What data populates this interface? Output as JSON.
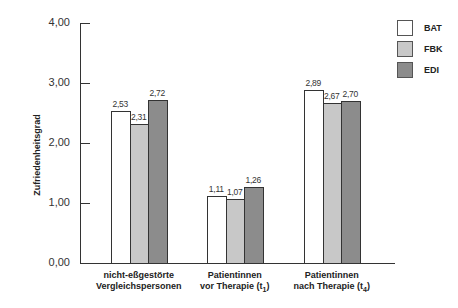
{
  "chart_data": {
    "type": "bar",
    "title": "",
    "xlabel": "",
    "ylabel": "Zufriedenheitsgrad",
    "ylim": [
      0,
      4
    ],
    "yticks": [
      "0,00",
      "1,00",
      "2,00",
      "3,00",
      "4,00"
    ],
    "grid": false,
    "legend_position": "top-right",
    "categories": [
      {
        "line1": "nicht-eßgestörte",
        "line2": "Vergleichspersonen",
        "sub": ""
      },
      {
        "line1": "Patientinnen",
        "line2": "vor Therapie (t",
        "sub": "1"
      },
      {
        "line1": "Patientinnen",
        "line2": "nach Therapie (t",
        "sub": "4"
      }
    ],
    "series": [
      {
        "name": "BAT",
        "color": "#ffffff",
        "values": [
          2.53,
          1.11,
          2.89
        ],
        "labels": [
          "2,53",
          "1,11",
          "2,89"
        ]
      },
      {
        "name": "FBK",
        "color": "#c8c8c8",
        "values": [
          2.31,
          1.07,
          2.67
        ],
        "labels": [
          "2,31",
          "1,07",
          "2,67"
        ]
      },
      {
        "name": "EDI",
        "color": "#8c8c8c",
        "values": [
          2.72,
          1.26,
          2.7
        ],
        "labels": [
          "2,72",
          "1,26",
          "2,70"
        ]
      }
    ]
  }
}
